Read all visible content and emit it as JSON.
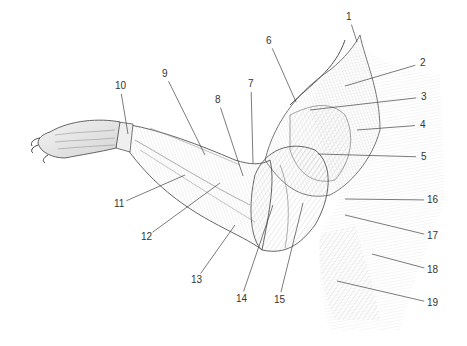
{
  "diagram": {
    "type": "anatomical-illustration",
    "labels": [
      {
        "num": "1",
        "x": 349,
        "y": 17,
        "tx": 357,
        "ty": 42
      },
      {
        "num": "2",
        "x": 423,
        "y": 63,
        "tx": 345,
        "ty": 86
      },
      {
        "num": "3",
        "x": 424,
        "y": 97,
        "tx": 310,
        "ty": 110
      },
      {
        "num": "4",
        "x": 423,
        "y": 125,
        "tx": 357,
        "ty": 130
      },
      {
        "num": "5",
        "x": 424,
        "y": 157,
        "tx": 318,
        "ty": 154
      },
      {
        "num": "6",
        "x": 269,
        "y": 41,
        "tx": 296,
        "ty": 102
      },
      {
        "num": "7",
        "x": 251,
        "y": 84,
        "tx": 253,
        "ty": 163
      },
      {
        "num": "8",
        "x": 218,
        "y": 100,
        "tx": 243,
        "ty": 176
      },
      {
        "num": "9",
        "x": 165,
        "y": 74,
        "tx": 205,
        "ty": 155
      },
      {
        "num": "10",
        "x": 120,
        "y": 86,
        "tx": 128,
        "ty": 134
      },
      {
        "num": "11",
        "x": 119,
        "y": 204,
        "tx": 185,
        "ty": 175
      },
      {
        "num": "12",
        "x": 146,
        "y": 237,
        "tx": 220,
        "ty": 183
      },
      {
        "num": "13",
        "x": 196,
        "y": 280,
        "tx": 235,
        "ty": 225
      },
      {
        "num": "14",
        "x": 241,
        "y": 299,
        "tx": 273,
        "ty": 205
      },
      {
        "num": "15",
        "x": 279,
        "y": 300,
        "tx": 303,
        "ty": 203
      },
      {
        "num": "16",
        "x": 432,
        "y": 200,
        "tx": 345,
        "ty": 199
      },
      {
        "num": "17",
        "x": 432,
        "y": 236,
        "tx": 345,
        "ty": 215
      },
      {
        "num": "18",
        "x": 432,
        "y": 270,
        "tx": 372,
        "ty": 254
      },
      {
        "num": "19",
        "x": 432,
        "y": 303,
        "tx": 337,
        "ty": 281
      }
    ]
  },
  "colors": {
    "background": "#ffffff",
    "ink": "#4a4a4a",
    "label_text": "#333333",
    "shade_light": "#e6e6e6",
    "shade_mid": "#c8c8c8"
  }
}
